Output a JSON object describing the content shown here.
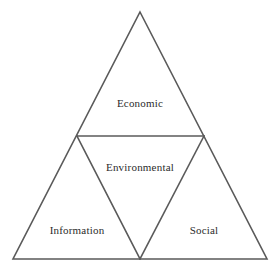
{
  "diagram": {
    "type": "nested-triangle",
    "background_color": "#ffffff",
    "line_color": "#5a5a5a",
    "text_color": "#2b2b2b",
    "outer_triangle": {
      "apex": [
        140,
        12
      ],
      "bottom_left": [
        13,
        259
      ],
      "bottom_right": [
        267,
        259
      ]
    },
    "midpoints": {
      "left": [
        77,
        136
      ],
      "right": [
        204,
        136
      ],
      "bottom": [
        140,
        259
      ]
    },
    "regions": [
      {
        "id": "top",
        "label": "Economic",
        "orientation": "upright",
        "label_x": 140,
        "label_y": 107
      },
      {
        "id": "center",
        "label": "Environmental",
        "orientation": "inverted",
        "label_x": 140,
        "label_y": 171
      },
      {
        "id": "bottom-left",
        "label": "Information",
        "orientation": "upright",
        "label_x": 77,
        "label_y": 234
      },
      {
        "id": "bottom-right",
        "label": "Social",
        "orientation": "upright",
        "label_x": 204,
        "label_y": 234
      }
    ]
  }
}
